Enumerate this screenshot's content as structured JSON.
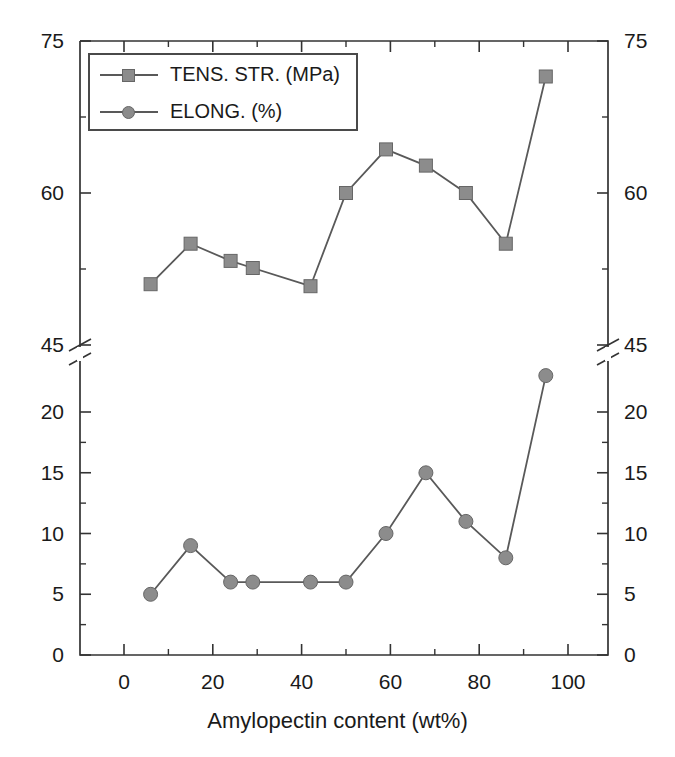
{
  "chart_data": {
    "type": "line",
    "title": "",
    "xlabel": "Amylopectin content (wt%)",
    "ylabel": "",
    "xlim": [
      -10,
      110
    ],
    "xticks": [
      0,
      20,
      40,
      60,
      80,
      100
    ],
    "xtick_labels": [
      "0",
      "20",
      "40",
      "60",
      "80",
      "100"
    ],
    "grid": false,
    "legend_position": "upper left",
    "broken_axis": {
      "break_value": 45,
      "lower_range": [
        0,
        20
      ],
      "lower_ticks": [
        0,
        5,
        10,
        15,
        20
      ],
      "lower_tick_labels": [
        "0",
        "5",
        "10",
        "15",
        "20"
      ],
      "upper_range": [
        45,
        75
      ],
      "upper_ticks": [
        45,
        60,
        75
      ],
      "upper_tick_labels": [
        "45",
        "60",
        "75"
      ],
      "minor_tick_step_lower": 2.5,
      "minor_tick_step_upper": 7.5
    },
    "axes_note": "Left and right y-axes carry identical broken-scale labels; tensile strength is read on the upper segment (45-75 MPa) and elongation on the lower segment (0-20 %).",
    "series": [
      {
        "name": "TENS. STR. (MPa)",
        "marker": "square",
        "color": "#8c8c8c",
        "line_color": "#595959",
        "axis_segment": "upper",
        "x": [
          6,
          15,
          24,
          29,
          42,
          50,
          59,
          68,
          77,
          86,
          95
        ],
        "values": [
          51,
          55,
          53.3,
          52.6,
          50.8,
          60,
          64.3,
          62.7,
          60,
          55,
          71.5
        ]
      },
      {
        "name": "ELONG. (%)",
        "marker": "circle",
        "color": "#8c8c8c",
        "line_color": "#595959",
        "axis_segment": "lower",
        "x": [
          6,
          15,
          24,
          29,
          42,
          50,
          59,
          68,
          77,
          86,
          95
        ],
        "values": [
          5,
          9,
          6,
          6,
          6,
          6,
          10,
          15,
          11,
          8,
          23
        ]
      }
    ]
  },
  "legend": {
    "entries": [
      {
        "label": "TENS. STR. (MPa)",
        "marker": "square"
      },
      {
        "label": "ELONG. (%)",
        "marker": "circle"
      }
    ]
  },
  "axis_labels": {
    "x_title": "Amylopectin content (wt%)"
  },
  "colors": {
    "marker_fill": "#8c8c8c",
    "marker_edge": "#666666",
    "line": "#595959",
    "axis": "#333333",
    "text": "#1a1a1a",
    "background": "#ffffff"
  }
}
